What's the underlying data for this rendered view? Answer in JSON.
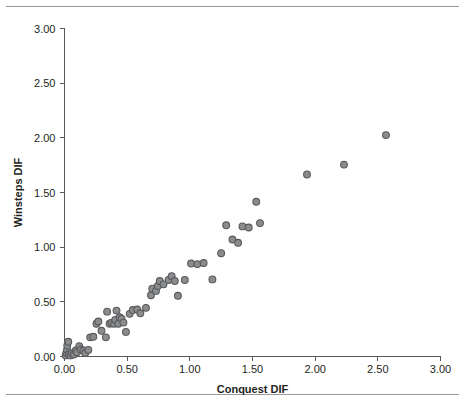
{
  "figure": {
    "has_top_rule": true,
    "has_bottom_rule": true,
    "rule_color": "#9a9a9a",
    "background": "#ffffff"
  },
  "chart_data": {
    "type": "scatter",
    "title": "",
    "xlabel": "Conquest DIF",
    "ylabel": "Winsteps DIF",
    "xlim": [
      0.0,
      3.0
    ],
    "ylim": [
      0.0,
      3.0
    ],
    "grid": false,
    "legend": null,
    "marker": {
      "shape": "circle",
      "fill_color": "#8a8c8e",
      "edge_color": "#58595b",
      "radius_px": 3.4
    },
    "axis_color": "#58595b",
    "xticks": [
      0.0,
      0.5,
      1.0,
      1.5,
      2.0,
      2.5,
      3.0
    ],
    "xticklabels": [
      "0.00",
      "0.50",
      "1.00",
      "1.50",
      "2.00",
      "2.50",
      "3.00"
    ],
    "yticks": [
      0.0,
      0.5,
      1.0,
      1.5,
      2.0,
      2.5,
      3.0
    ],
    "yticklabels": [
      "0.00",
      "0.50",
      "1.00",
      "1.50",
      "2.00",
      "2.50",
      "3.00"
    ],
    "points": [
      [
        0.01,
        0.01
      ],
      [
        0.015,
        0.035
      ],
      [
        0.02,
        0.06
      ],
      [
        0.022,
        0.1
      ],
      [
        0.03,
        0.135
      ],
      [
        0.035,
        0.02
      ],
      [
        0.048,
        0.01
      ],
      [
        0.06,
        0.03
      ],
      [
        0.075,
        0.018
      ],
      [
        0.09,
        0.055
      ],
      [
        0.1,
        0.04
      ],
      [
        0.118,
        0.095
      ],
      [
        0.13,
        0.065
      ],
      [
        0.15,
        0.055
      ],
      [
        0.165,
        0.032
      ],
      [
        0.19,
        0.06
      ],
      [
        0.205,
        0.175
      ],
      [
        0.23,
        0.18
      ],
      [
        0.255,
        0.3
      ],
      [
        0.27,
        0.32
      ],
      [
        0.295,
        0.235
      ],
      [
        0.33,
        0.175
      ],
      [
        0.34,
        0.41
      ],
      [
        0.36,
        0.3
      ],
      [
        0.375,
        0.31
      ],
      [
        0.395,
        0.3
      ],
      [
        0.405,
        0.335
      ],
      [
        0.415,
        0.42
      ],
      [
        0.43,
        0.3
      ],
      [
        0.44,
        0.36
      ],
      [
        0.455,
        0.345
      ],
      [
        0.47,
        0.31
      ],
      [
        0.49,
        0.225
      ],
      [
        0.52,
        0.39
      ],
      [
        0.545,
        0.425
      ],
      [
        0.58,
        0.43
      ],
      [
        0.605,
        0.395
      ],
      [
        0.65,
        0.445
      ],
      [
        0.69,
        0.56
      ],
      [
        0.7,
        0.62
      ],
      [
        0.73,
        0.6
      ],
      [
        0.745,
        0.645
      ],
      [
        0.76,
        0.69
      ],
      [
        0.79,
        0.66
      ],
      [
        0.83,
        0.7
      ],
      [
        0.855,
        0.735
      ],
      [
        0.88,
        0.69
      ],
      [
        0.905,
        0.555
      ],
      [
        0.96,
        0.7
      ],
      [
        1.01,
        0.85
      ],
      [
        1.06,
        0.845
      ],
      [
        1.11,
        0.855
      ],
      [
        1.18,
        0.705
      ],
      [
        1.25,
        0.945
      ],
      [
        1.29,
        1.2
      ],
      [
        1.34,
        1.07
      ],
      [
        1.385,
        1.04
      ],
      [
        1.42,
        1.19
      ],
      [
        1.47,
        1.18
      ],
      [
        1.53,
        1.415
      ],
      [
        1.56,
        1.22
      ],
      [
        1.935,
        1.665
      ],
      [
        2.23,
        1.755
      ],
      [
        2.565,
        2.025
      ]
    ]
  }
}
